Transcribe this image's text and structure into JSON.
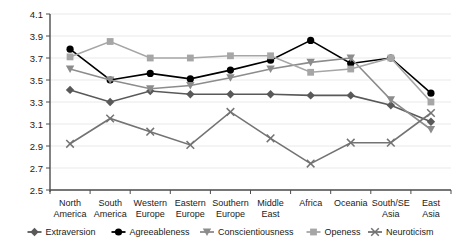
{
  "chart_data": {
    "type": "line",
    "title": "",
    "xlabel": "",
    "ylabel": "",
    "ylim": [
      2.5,
      4.1
    ],
    "ytick_labels": [
      "4.1",
      "3.9",
      "3.7",
      "3.5",
      "3.3",
      "3.1",
      "2.9",
      "2.7",
      "2.5"
    ],
    "ytick_values": [
      4.1,
      3.9,
      3.7,
      3.5,
      3.3,
      3.1,
      2.9,
      2.7,
      2.5
    ],
    "grid": true,
    "legend_position": "bottom",
    "categories": [
      "North America",
      "South America",
      "Western Europe",
      "Eastern Europe",
      "Southern Europe",
      "Middle East",
      "Africa",
      "Oceania",
      "South/SE Asia",
      "East Asia"
    ],
    "series": [
      {
        "name": "Extraversion",
        "marker": "diamond",
        "color": "#595959",
        "values": [
          3.41,
          3.3,
          3.4,
          3.37,
          3.37,
          3.37,
          3.36,
          3.36,
          3.27,
          3.12
        ]
      },
      {
        "name": "Agreeableness",
        "marker": "circle",
        "color": "#000000",
        "values": [
          3.78,
          3.5,
          3.56,
          3.51,
          3.59,
          3.68,
          3.86,
          3.65,
          3.7,
          3.38
        ]
      },
      {
        "name": "Conscientiousness",
        "marker": "triangle-down",
        "color": "#8c8c8c",
        "values": [
          3.6,
          3.5,
          3.42,
          3.45,
          3.52,
          3.6,
          3.66,
          3.7,
          3.32,
          3.05
        ]
      },
      {
        "name": "Openess",
        "marker": "square",
        "color": "#a6a6a6",
        "values": [
          3.71,
          3.85,
          3.7,
          3.7,
          3.72,
          3.72,
          3.57,
          3.6,
          3.7,
          3.3
        ]
      },
      {
        "name": "Neuroticism",
        "marker": "cross",
        "color": "#737373",
        "values": [
          2.92,
          3.15,
          3.03,
          2.91,
          3.21,
          2.97,
          2.74,
          2.93,
          2.93,
          3.2
        ]
      }
    ]
  }
}
